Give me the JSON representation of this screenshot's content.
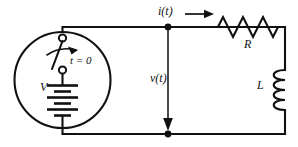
{
  "diagram": {
    "colors": {
      "wire": "#111111",
      "background": "#ffffff",
      "node": "#111111"
    },
    "labels": {
      "current": "i(t)",
      "voltage": "v(t)",
      "resistor": "R",
      "inductor": "L",
      "source": "V",
      "switch_time": "t = 0"
    },
    "components": [
      {
        "name": "voltage-source",
        "symbol": "battery",
        "label": "V"
      },
      {
        "name": "switch",
        "symbol": "spst-switch",
        "label": "t = 0"
      },
      {
        "name": "resistor",
        "symbol": "zigzag",
        "label": "R"
      },
      {
        "name": "inductor",
        "symbol": "coil",
        "label": "L"
      }
    ],
    "nodes": [
      {
        "name": "top-junction",
        "x": 168,
        "y": 27
      },
      {
        "name": "bottom-junction",
        "x": 168,
        "y": 134
      }
    ]
  }
}
